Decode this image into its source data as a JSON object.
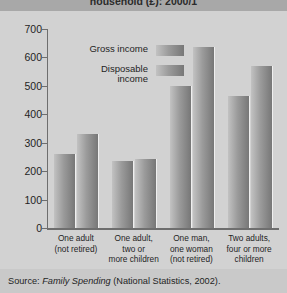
{
  "title": "household (£): 2000/1",
  "source": {
    "prefix": "Source: ",
    "italic": "Family Spending",
    "suffix": " (National Statistics, 2002)."
  },
  "legend": {
    "items": [
      {
        "label_line1": "Gross income",
        "label_line2": "",
        "color": "#9b9b9b"
      },
      {
        "label_line1": "Disposable",
        "label_line2": "income",
        "color": "#9b9b9b"
      }
    ]
  },
  "axis": {
    "y_ticks": [
      "0",
      "100",
      "200",
      "300",
      "400",
      "500",
      "600",
      "700"
    ]
  },
  "chart_data": {
    "type": "bar",
    "title": "household (£): 2000/1",
    "xlabel": "",
    "ylabel": "",
    "ylim": [
      0,
      700
    ],
    "ytick_step": 100,
    "grid": false,
    "legend_position": "top-left-inside",
    "categories": [
      "One adult (not retired)",
      "One adult, two or more children",
      "One man, one woman (not retired)",
      "Two adults, four or more children"
    ],
    "category_lines": [
      [
        "One adult",
        "(not retired)"
      ],
      [
        "One adult,",
        "two or",
        "more children"
      ],
      [
        "One man,",
        "one woman",
        "(not retired)"
      ],
      [
        "Two adults,",
        "four or more",
        "children"
      ]
    ],
    "series": [
      {
        "name": "Gross income",
        "values": [
          330,
          243,
          636,
          570
        ]
      },
      {
        "name": "Disposable income",
        "values": [
          262,
          237,
          499,
          463
        ]
      }
    ]
  }
}
